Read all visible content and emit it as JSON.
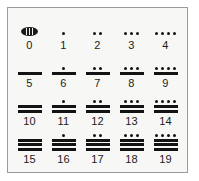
{
  "figure": {
    "border_color": "#9a9a9a",
    "background_color": "#f7f7f5",
    "ink_color": "#131313"
  },
  "legend": {
    "shell_icon_name": "shell-zero-glyph",
    "dot_value": "1",
    "bar_value": "5"
  },
  "chart_data": {
    "type": "table",
    "xlabel": "",
    "ylabel": "",
    "rows": [
      {
        "cells": [
          {
            "label": "0",
            "dots": 0,
            "bars": 0,
            "shell": true
          },
          {
            "label": "1",
            "dots": 1,
            "bars": 0,
            "shell": false
          },
          {
            "label": "2",
            "dots": 2,
            "bars": 0,
            "shell": false
          },
          {
            "label": "3",
            "dots": 3,
            "bars": 0,
            "shell": false
          },
          {
            "label": "4",
            "dots": 4,
            "bars": 0,
            "shell": false
          }
        ]
      },
      {
        "cells": [
          {
            "label": "5",
            "dots": 0,
            "bars": 1,
            "shell": false
          },
          {
            "label": "6",
            "dots": 1,
            "bars": 1,
            "shell": false
          },
          {
            "label": "7",
            "dots": 2,
            "bars": 1,
            "shell": false
          },
          {
            "label": "8",
            "dots": 3,
            "bars": 1,
            "shell": false
          },
          {
            "label": "9",
            "dots": 4,
            "bars": 1,
            "shell": false
          }
        ]
      },
      {
        "cells": [
          {
            "label": "10",
            "dots": 0,
            "bars": 2,
            "shell": false
          },
          {
            "label": "11",
            "dots": 1,
            "bars": 2,
            "shell": false
          },
          {
            "label": "12",
            "dots": 2,
            "bars": 2,
            "shell": false
          },
          {
            "label": "13",
            "dots": 3,
            "bars": 2,
            "shell": false
          },
          {
            "label": "14",
            "dots": 4,
            "bars": 2,
            "shell": false
          }
        ]
      },
      {
        "cells": [
          {
            "label": "15",
            "dots": 0,
            "bars": 3,
            "shell": false
          },
          {
            "label": "16",
            "dots": 1,
            "bars": 3,
            "shell": false
          },
          {
            "label": "17",
            "dots": 2,
            "bars": 3,
            "shell": false
          },
          {
            "label": "18",
            "dots": 3,
            "bars": 3,
            "shell": false
          },
          {
            "label": "19",
            "dots": 4,
            "bars": 3,
            "shell": false
          }
        ]
      }
    ]
  }
}
